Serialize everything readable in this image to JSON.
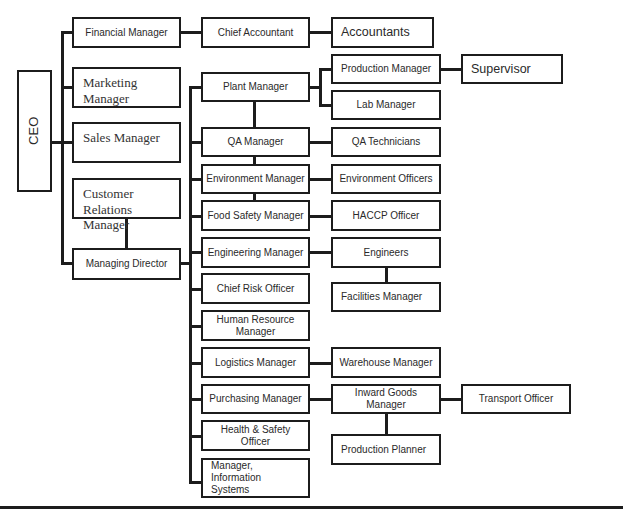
{
  "chart_title": "Organisational Chart",
  "ceo": {
    "label": "CEO"
  },
  "level1": {
    "financial_manager": "Financial Manager",
    "marketing_manager": "Marketing Manager",
    "sales_manager": "Sales Manager",
    "customer_relations_manager": "Customer Relations Manager",
    "managing_director": "Managing Director"
  },
  "finance_chain": {
    "chief_accountant": "Chief Accountant",
    "accountants": "Accountants"
  },
  "md_reports": {
    "plant_manager": "Plant Manager",
    "qa_manager": "QA Manager",
    "environment_manager": "Environment Manager",
    "food_safety_manager": "Food Safety Manager",
    "engineering_manager": "Engineering Manager",
    "chief_risk_officer": "Chief Risk Officer",
    "human_resource_manager": "Human Resource Manager",
    "logistics_manager": "Logistics Manager",
    "purchasing_manager": "Purchasing Manager",
    "health_safety_officer": "Health & Safety Officer",
    "manager_information_systems": "Manager, Information Systems"
  },
  "level3": {
    "production_manager": "Production Manager",
    "lab_manager": "Lab Manager",
    "supervisor": "Supervisor",
    "qa_technicians": "QA Technicians",
    "environment_officers": "Environment Officers",
    "haccp_officer": "HACCP Officer",
    "engineers": "Engineers",
    "facilities_manager": "Facilities Manager",
    "warehouse_manager": "Warehouse Manager",
    "inward_goods_manager": "Inward Goods Manager",
    "transport_officer": "Transport Officer",
    "production_planner": "Production Planner"
  },
  "colors": {
    "line": "#1c1c1c",
    "box_fill": "#ffffff",
    "text": "#2a2a2a"
  }
}
